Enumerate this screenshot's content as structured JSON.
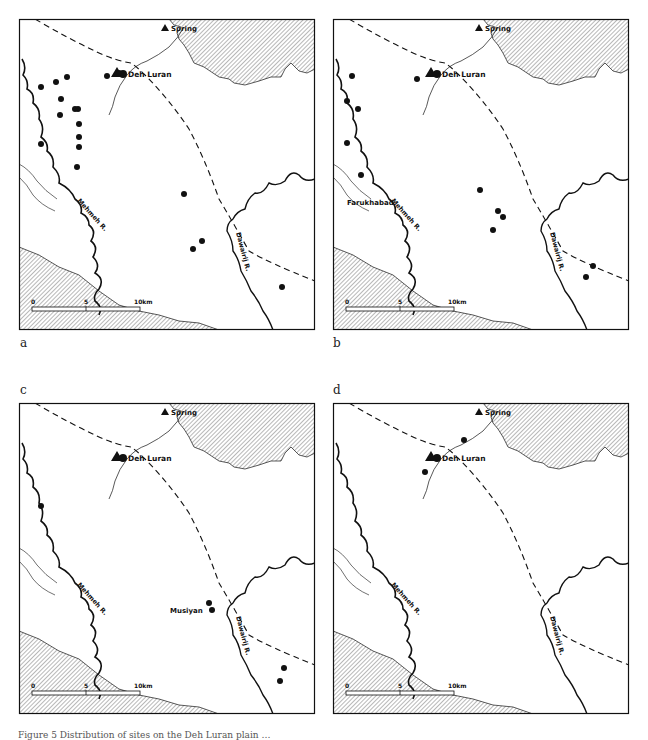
{
  "figure": {
    "caption": "Figure 5 Distribution of sites on the Deh Luran plain …",
    "colors": {
      "ink": "#111111",
      "hatch": "#9a9a9a",
      "background": "#ffffff"
    }
  },
  "labels": {
    "spring": "Spring",
    "deh_luran": "Deh Luran",
    "mehmeh": "Mehmeh R.",
    "dawairij": "Dawairij R.",
    "farukhabad": "Farukhabad",
    "musiyan": "Musiyan"
  },
  "scale_bar": {
    "ticks": [
      "0",
      "5",
      "10km"
    ]
  },
  "panels": [
    {
      "letter": "a",
      "sites": [
        [
          37,
          63
        ],
        [
          48,
          58
        ],
        [
          22,
          68
        ],
        [
          42,
          80
        ],
        [
          56,
          90
        ],
        [
          59,
          90
        ],
        [
          41,
          96
        ],
        [
          60,
          105
        ],
        [
          60,
          118
        ],
        [
          22,
          125
        ],
        [
          60,
          128
        ],
        [
          58,
          148
        ],
        [
          165,
          175
        ],
        [
          183,
          222
        ],
        [
          174,
          230
        ],
        [
          263,
          268
        ],
        [
          88,
          57
        ],
        [
          100,
          54
        ]
      ],
      "extra_labels": []
    },
    {
      "letter": "b",
      "sites": [
        [
          19,
          57
        ],
        [
          14,
          82
        ],
        [
          25,
          90
        ],
        [
          14,
          124
        ],
        [
          28,
          156
        ],
        [
          147,
          171
        ],
        [
          165,
          192
        ],
        [
          170,
          198
        ],
        [
          160,
          211
        ],
        [
          260,
          247
        ],
        [
          253,
          258
        ],
        [
          84,
          60
        ]
      ],
      "extra_labels": [
        {
          "key": "farukhabad",
          "x": 14,
          "y": 186
        }
      ]
    },
    {
      "letter": "c",
      "sites": [
        [
          22,
          103
        ],
        [
          190,
          200
        ],
        [
          193,
          207
        ],
        [
          265,
          265
        ],
        [
          261,
          278
        ]
      ],
      "extra_labels": [
        {
          "key": "musiyan",
          "x": 151,
          "y": 210
        }
      ]
    },
    {
      "letter": "d",
      "sites": [
        [
          131,
          37
        ],
        [
          92,
          69
        ]
      ],
      "extra_labels": []
    }
  ]
}
